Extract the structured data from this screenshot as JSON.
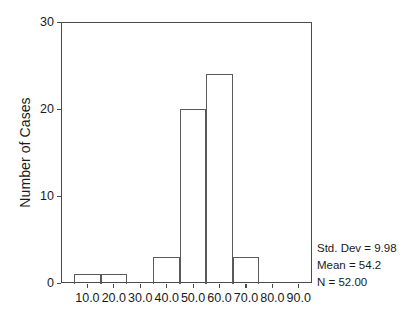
{
  "chart_data": {
    "type": "bar",
    "chart_subtype": "histogram",
    "title": "",
    "xlabel": "",
    "ylabel": "Number of Cases",
    "xlim": [
      0,
      95
    ],
    "ylim": [
      0,
      30
    ],
    "grid": false,
    "legend": "none",
    "y_ticks": [
      0,
      10,
      20,
      30
    ],
    "y_tick_labels": [
      "0",
      "10",
      "20",
      "30"
    ],
    "x_ticks": [
      10,
      20,
      30,
      40,
      50,
      60,
      70,
      80,
      90
    ],
    "x_tick_labels": [
      "10.0",
      "20.0",
      "30.0",
      "40.0",
      "50.0",
      "60.0",
      "70.0",
      "80.0",
      "90.0"
    ],
    "bin_width": 10,
    "bins": [
      {
        "label": "5-15",
        "start": 5,
        "end": 15,
        "value": 1
      },
      {
        "label": "15-25",
        "start": 15,
        "end": 25,
        "value": 1
      },
      {
        "label": "25-35",
        "start": 25,
        "end": 35,
        "value": 0
      },
      {
        "label": "35-45",
        "start": 35,
        "end": 45,
        "value": 3
      },
      {
        "label": "45-55",
        "start": 45,
        "end": 55,
        "value": 20
      },
      {
        "label": "55-65",
        "start": 55,
        "end": 65,
        "value": 24
      },
      {
        "label": "65-75",
        "start": 65,
        "end": 75,
        "value": 3
      },
      {
        "label": "75-85",
        "start": 75,
        "end": 85,
        "value": 0
      },
      {
        "label": "85-95",
        "start": 85,
        "end": 95,
        "value": 0
      }
    ],
    "categories": [
      "5-15",
      "15-25",
      "25-35",
      "35-45",
      "45-55",
      "55-65",
      "65-75",
      "75-85",
      "85-95"
    ],
    "values": [
      1,
      1,
      0,
      3,
      20,
      24,
      3,
      0,
      0
    ],
    "annotations": [
      "Std. Dev = 9.98",
      "Mean = 54.2",
      "N = 52.00"
    ],
    "colors": {
      "bar_outline": "#5a5a5a",
      "bar_fill": "transparent",
      "axis": "#4a4a4a",
      "text": "#1a1a1a",
      "background": "#ffffff"
    }
  },
  "stats": {
    "std_dev": "Std. Dev = 9.98",
    "mean": "Mean = 54.2",
    "n": "N = 52.00"
  },
  "axes": {
    "y_title": "Number of Cases"
  }
}
